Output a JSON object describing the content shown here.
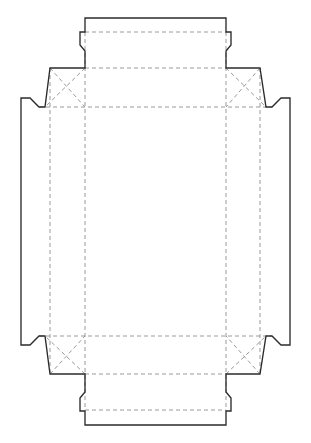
{
  "document": {
    "title": "Box Dieline Template",
    "type": "packaging-dieline",
    "description": "Flat unfolded carton die-cut layout with cut outline and dashed fold/crease lines",
    "canvas": {
      "width": 311,
      "height": 443,
      "background_color": "#ffffff"
    }
  },
  "legend": {
    "cut_line": {
      "name": "Cut line",
      "style": "solid",
      "color": "#2b2b2b",
      "width": 1.35
    },
    "fold_line": {
      "name": "Fold / crease line",
      "style": "dashed",
      "color": "#9a9a9a",
      "width": 1,
      "dash_pattern": "4 3"
    }
  },
  "geometry": {
    "main_panel": {
      "name": "center-panel",
      "x": 85,
      "y": 107,
      "width": 141,
      "height": 229
    },
    "fold_lines_vertical_x": [
      50,
      85,
      226,
      260
    ],
    "fold_lines_horizontal_y": [
      32,
      68,
      107,
      336,
      374,
      410
    ],
    "outline_path": "M 85 18 L 226 18 L 226 32 L 231 32 L 231 45 L 226 51 L 226 68 L 260 68 L 266 107 L 272 107 L 281 98 L 290 98 L 290 345 L 281 345 L 272 336 L 266 336 L 260 374 L 226 374 L 226 392 L 231 398 L 231 411 L 226 411 L 226 425 L 85 425 L 85 411 L 80 411 L 80 398 L 85 392 L 85 374 L 50 374 L 45 336 L 39 336 L 30 345 L 21 345 L 21 98 L 30 98 L 39 107 L 45 107 L 50 68 L 85 68 L 85 51 L 80 45 L 80 32 L 85 32 Z",
    "diagonal_folds": [
      {
        "name": "fold-diag-top-left",
        "x1": 50,
        "y1": 68,
        "x2": 85,
        "y2": 107
      },
      {
        "name": "fold-diag-top-left-inner",
        "x1": 85,
        "y1": 68,
        "x2": 45,
        "y2": 107
      },
      {
        "name": "fold-diag-top-right",
        "x1": 260,
        "y1": 68,
        "x2": 226,
        "y2": 107
      },
      {
        "name": "fold-diag-top-right-inner",
        "x1": 226,
        "y1": 68,
        "x2": 266,
        "y2": 107
      },
      {
        "name": "fold-diag-bottom-left",
        "x1": 50,
        "y1": 374,
        "x2": 85,
        "y2": 336
      },
      {
        "name": "fold-diag-bottom-left-inner",
        "x1": 85,
        "y1": 374,
        "x2": 45,
        "y2": 336
      },
      {
        "name": "fold-diag-bottom-right",
        "x1": 260,
        "y1": 374,
        "x2": 226,
        "y2": 336
      },
      {
        "name": "fold-diag-bottom-right-inner",
        "x1": 226,
        "y1": 374,
        "x2": 266,
        "y2": 336
      }
    ]
  },
  "panels": [
    {
      "id": "top-tuck-flap",
      "label": "Top tuck flap"
    },
    {
      "id": "top-panel",
      "label": "Top panel"
    },
    {
      "id": "center-panel",
      "label": "Center base panel"
    },
    {
      "id": "bottom-panel",
      "label": "Bottom panel"
    },
    {
      "id": "bottom-tuck-flap",
      "label": "Bottom tuck flap"
    },
    {
      "id": "left-side-panel",
      "label": "Left side panel"
    },
    {
      "id": "right-side-panel",
      "label": "Right side panel"
    },
    {
      "id": "corner-gusset-top-left",
      "label": "Top left corner gusset"
    },
    {
      "id": "corner-gusset-top-right",
      "label": "Top right corner gusset"
    },
    {
      "id": "corner-gusset-bottom-left",
      "label": "Bottom left corner gusset"
    },
    {
      "id": "corner-gusset-bottom-right",
      "label": "Bottom right corner gusset"
    }
  ]
}
